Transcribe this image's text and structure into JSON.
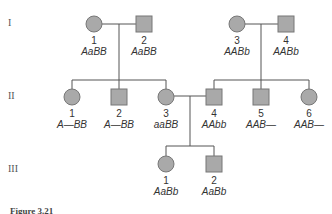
{
  "generations": [
    {
      "label": "I"
    },
    {
      "label": "II"
    },
    {
      "label": "III"
    }
  ],
  "individuals": {
    "I": [
      {
        "num": "1",
        "genotype": "AaBB",
        "sex": "female"
      },
      {
        "num": "2",
        "genotype": "AaBB",
        "sex": "male"
      },
      {
        "num": "3",
        "genotype": "AABb",
        "sex": "female"
      },
      {
        "num": "4",
        "genotype": "AABb",
        "sex": "male"
      }
    ],
    "II": [
      {
        "num": "1",
        "genotype": "A—BB",
        "sex": "female"
      },
      {
        "num": "2",
        "genotype": "A—BB",
        "sex": "male"
      },
      {
        "num": "3",
        "genotype": "aaBB",
        "sex": "female"
      },
      {
        "num": "4",
        "genotype": "AAbb",
        "sex": "male"
      },
      {
        "num": "5",
        "genotype": "AAB—",
        "sex": "male"
      },
      {
        "num": "6",
        "genotype": "AAB—",
        "sex": "female"
      }
    ],
    "III": [
      {
        "num": "1",
        "genotype": "AaBb",
        "sex": "female"
      },
      {
        "num": "2",
        "genotype": "AaBb",
        "sex": "male"
      }
    ]
  },
  "caption": "Figure 3.21",
  "colors": {
    "fill": "#a9a9a9",
    "stroke": "#777777",
    "line": "#555555"
  }
}
